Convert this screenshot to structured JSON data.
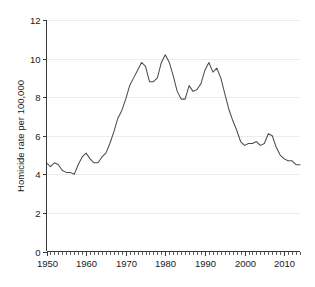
{
  "chart_data": {
    "type": "line",
    "title": "",
    "subtitle": "",
    "xlabel": "",
    "ylabel": "Homicide rate per 100,000",
    "xlim": [
      1950,
      2014
    ],
    "ylim": [
      0,
      12
    ],
    "grid": true,
    "legend": false,
    "legend_position": "none",
    "x_major_ticks": [
      1950,
      1960,
      1970,
      1980,
      1990,
      2000,
      2010
    ],
    "x_tick_labels": [
      "1950",
      "1960",
      "1970",
      "1980",
      "1990",
      "2000",
      "2010"
    ],
    "x_minor_tick_step": 1,
    "y_major_ticks": [
      0,
      2,
      4,
      6,
      8,
      10,
      12
    ],
    "y_tick_labels": [
      "0",
      "2",
      "4",
      "6",
      "8",
      "10",
      "12"
    ],
    "line_color": "#4d4d4d",
    "gridline_color": "#ececed",
    "axis_color": "#3a3a3a",
    "series": [
      {
        "name": "Homicide rate per 100,000",
        "x": [
          1950,
          1951,
          1952,
          1953,
          1954,
          1955,
          1956,
          1957,
          1958,
          1959,
          1960,
          1961,
          1962,
          1963,
          1964,
          1965,
          1966,
          1967,
          1968,
          1969,
          1970,
          1971,
          1972,
          1973,
          1974,
          1975,
          1976,
          1977,
          1978,
          1979,
          1980,
          1981,
          1982,
          1983,
          1984,
          1985,
          1986,
          1987,
          1988,
          1989,
          1990,
          1991,
          1992,
          1993,
          1994,
          1995,
          1996,
          1997,
          1998,
          1999,
          2000,
          2001,
          2002,
          2003,
          2004,
          2005,
          2006,
          2007,
          2008,
          2009,
          2010,
          2011,
          2012,
          2013,
          2014
        ],
        "values": [
          4.6,
          4.4,
          4.6,
          4.5,
          4.2,
          4.1,
          4.1,
          4.0,
          4.5,
          4.9,
          5.1,
          4.8,
          4.6,
          4.6,
          4.9,
          5.1,
          5.6,
          6.2,
          6.9,
          7.3,
          7.9,
          8.6,
          9.0,
          9.4,
          9.8,
          9.6,
          8.8,
          8.8,
          9.0,
          9.8,
          10.2,
          9.8,
          9.1,
          8.3,
          7.9,
          7.9,
          8.6,
          8.3,
          8.4,
          8.7,
          9.4,
          9.8,
          9.3,
          9.5,
          9.0,
          8.2,
          7.4,
          6.8,
          6.3,
          5.7,
          5.5,
          5.6,
          5.6,
          5.7,
          5.5,
          5.6,
          6.1,
          6.0,
          5.4,
          5.0,
          4.8,
          4.7,
          4.7,
          4.5,
          4.5
        ]
      }
    ]
  },
  "axes": {
    "y_axis_title": "Homicide rate per 100,000"
  }
}
